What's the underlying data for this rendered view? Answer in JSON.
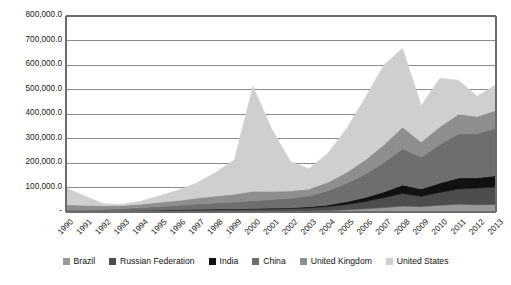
{
  "chart_data": {
    "type": "area",
    "stacked": true,
    "title": "",
    "subtitle": "",
    "xlabel": "",
    "ylabel": "",
    "grid": true,
    "legend_position": "bottom",
    "ylim": [
      0,
      800000
    ],
    "ytick_labels": [
      "-",
      "100,000.0",
      "200,000.0",
      "300,000.0",
      "400,000.0",
      "500,000.0",
      "600,000.0",
      "700,000.0",
      "800,000.0"
    ],
    "ytick_values": [
      0,
      100000,
      200000,
      300000,
      400000,
      500000,
      600000,
      700000,
      800000
    ],
    "categories": [
      "1990",
      "1991",
      "1992",
      "1993",
      "1994",
      "1995",
      "1996",
      "1997",
      "1998",
      "1999",
      "2000",
      "2001",
      "2002",
      "2003",
      "2004",
      "2005",
      "2006",
      "2007",
      "2008",
      "2009",
      "2010",
      "2011",
      "2012",
      "2013"
    ],
    "series": [
      {
        "name": "Brazil",
        "color": "#9a9a9a",
        "values": [
          1500,
          1600,
          1700,
          1800,
          2000,
          2300,
          2600,
          3000,
          3400,
          3500,
          3800,
          4000,
          4200,
          4500,
          6000,
          9000,
          13000,
          18000,
          24000,
          22000,
          28000,
          32000,
          30000,
          31000
        ]
      },
      {
        "name": "Russian Federation",
        "color": "#4d4d4d",
        "values": [
          0,
          0,
          1000,
          2000,
          3000,
          4000,
          5000,
          6000,
          6500,
          7000,
          8000,
          9000,
          10000,
          12000,
          16000,
          22000,
          30000,
          40000,
          52000,
          42000,
          52000,
          62000,
          68000,
          72000
        ]
      },
      {
        "name": "India",
        "color": "#111111",
        "values": [
          500,
          600,
          700,
          800,
          1000,
          1200,
          1500,
          1800,
          2000,
          2200,
          2600,
          3000,
          3500,
          4500,
          7000,
          11000,
          16000,
          24000,
          34000,
          30000,
          38000,
          45000,
          42000,
          45000
        ]
      },
      {
        "name": "China",
        "color": "#6e6e6e",
        "values": [
          6000,
          7000,
          8000,
          10000,
          12000,
          15000,
          18000,
          22000,
          25000,
          28000,
          32000,
          35000,
          38000,
          45000,
          58000,
          75000,
          95000,
          120000,
          148000,
          130000,
          158000,
          180000,
          180000,
          195000
        ]
      },
      {
        "name": "United Kingdom",
        "color": "#8e8e8e",
        "values": [
          22000,
          18000,
          14000,
          12000,
          14000,
          17000,
          20000,
          24000,
          28000,
          32000,
          38000,
          34000,
          30000,
          28000,
          34000,
          44000,
          58000,
          72000,
          88000,
          62000,
          72000,
          80000,
          70000,
          72000
        ]
      },
      {
        "name": "United States",
        "color": "#cfcfcf",
        "values": [
          68000,
          38000,
          8000,
          4000,
          12000,
          26000,
          42000,
          62000,
          96000,
          140000,
          428000,
          255000,
          120000,
          83000,
          118000,
          178000,
          253000,
          325000,
          322000,
          148000,
          198000,
          138000,
          82000,
          105000
        ]
      }
    ],
    "totals": [
      98000,
      65200,
      33400,
      30600,
      44000,
      65500,
      89100,
      138800,
      160900,
      212700,
      513400,
      340000,
      205700,
      177000,
      239000,
      339000,
      465000,
      599000,
      668000,
      434000,
      546000,
      537000,
      472000,
      520000
    ]
  },
  "legend": {
    "items": [
      {
        "label": "Brazil",
        "color": "#9a9a9a"
      },
      {
        "label": "Russian Federation",
        "color": "#4d4d4d"
      },
      {
        "label": "India",
        "color": "#111111"
      },
      {
        "label": "China",
        "color": "#6e6e6e"
      },
      {
        "label": "United Kingdom",
        "color": "#8e8e8e"
      },
      {
        "label": "United States",
        "color": "#cfcfcf"
      }
    ]
  },
  "axes": {
    "frame_color": "#6b6b6b",
    "grid_color": "#8a8a8a",
    "text_color": "#1a1a1a"
  }
}
